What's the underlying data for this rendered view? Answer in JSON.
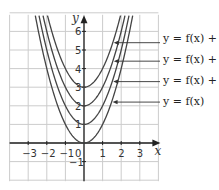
{
  "chart_data": {
    "type": "line",
    "title": "",
    "xlabel": "x",
    "ylabel": "y",
    "xlim": [
      -4,
      4
    ],
    "ylim": [
      -2,
      7
    ],
    "grid": true,
    "x_ticks": [
      "-3",
      "-2",
      "-1",
      "0",
      "1",
      "2",
      "3"
    ],
    "y_ticks": [
      "-1",
      "1",
      "2",
      "3",
      "4",
      "5",
      "6"
    ],
    "series": [
      {
        "name": "y = f(x) + 3",
        "vertex": [
          0,
          3
        ]
      },
      {
        "name": "y = f(x) + 2",
        "vertex": [
          0,
          2
        ]
      },
      {
        "name": "y = f(x) + 1",
        "vertex": [
          0,
          1
        ]
      },
      {
        "name": "y = f(x)",
        "vertex": [
          0,
          0
        ]
      }
    ],
    "annotations": [
      "y = f(x) + 3",
      "y = f(x) + 2",
      "y = f(x) + 1",
      "y = f(x)"
    ],
    "colors": {
      "curve": "#444444",
      "grid": "#cccccc",
      "axis": "#222222"
    }
  }
}
